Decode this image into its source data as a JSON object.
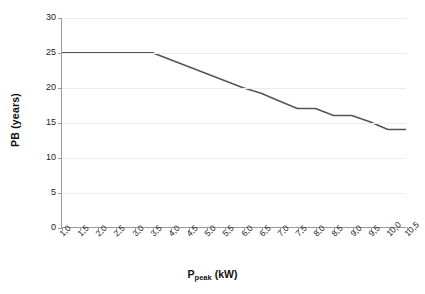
{
  "chart_data": {
    "type": "line",
    "title": "",
    "xlabel": "P_peak (kW)",
    "xlabel_base": "P",
    "xlabel_sub": "peak",
    "xlabel_unit": " (kW)",
    "ylabel": "PB (years)",
    "xlim": [
      1.0,
      10.5
    ],
    "ylim": [
      0,
      30
    ],
    "grid": true,
    "legend": "none",
    "line_color": "#555555",
    "gridline_color": "#ededed",
    "axis_color": "#9a9a9a",
    "x": [
      1.0,
      1.5,
      2.0,
      2.5,
      3.0,
      3.5,
      4.0,
      4.5,
      5.0,
      5.5,
      6.0,
      6.5,
      7.0,
      7.5,
      8.0,
      8.5,
      9.0,
      9.5,
      10.0,
      10.5
    ],
    "xticklabels": [
      "1,0",
      "1,5",
      "2,0",
      "2,5",
      "3,0",
      "3,5",
      "4,0",
      "4,5",
      "5,0",
      "5,5",
      "6,0",
      "6,5",
      "7,0",
      "7,5",
      "8,0",
      "8,5",
      "9,0",
      "9,5",
      "10,0",
      "10,5"
    ],
    "yticks": [
      0,
      5,
      10,
      15,
      20,
      25,
      30
    ],
    "yticklabels": [
      "0",
      "5",
      "10",
      "15",
      "20",
      "25",
      "30"
    ],
    "series": [
      {
        "name": "PB",
        "values": [
          25.0,
          25.0,
          25.0,
          25.0,
          25.0,
          25.0,
          24.0,
          23.0,
          22.0,
          21.0,
          20.0,
          19.2,
          18.1,
          17.0,
          17.0,
          16.0,
          16.0,
          15.1,
          14.0,
          14.0
        ]
      }
    ]
  }
}
